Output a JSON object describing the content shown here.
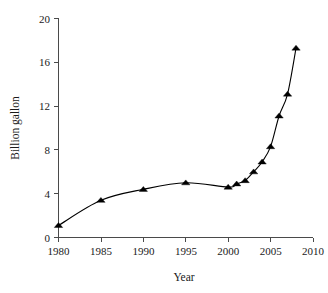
{
  "chart_data": {
    "type": "line",
    "title": "",
    "subtitle": "",
    "xlabel": "Year",
    "ylabel": "Billion gallon",
    "xlim": [
      1980,
      2010
    ],
    "ylim": [
      0,
      20
    ],
    "xticks": [
      1980,
      1985,
      1990,
      1995,
      2000,
      2005,
      2010
    ],
    "yticks": [
      0,
      4,
      8,
      12,
      16,
      20
    ],
    "grid": false,
    "legend": false,
    "legend_position": "none",
    "marker": "triangle-up",
    "marker_color": "#000000",
    "line_color": "#000000",
    "x": [
      1980,
      1985,
      1990,
      1995,
      2000,
      2001,
      2002,
      2003,
      2004,
      2005,
      2006,
      2007,
      2008
    ],
    "series": [
      {
        "name": "Billion gallon",
        "values": [
          1.1,
          3.4,
          4.4,
          5.0,
          4.6,
          4.9,
          5.2,
          6.0,
          6.9,
          8.3,
          11.1,
          13.1,
          17.3
        ]
      }
    ],
    "annotations": []
  },
  "axis": {
    "y_title": "Billion gallon",
    "x_title": "Year",
    "y_tick_labels": [
      "0",
      "4",
      "8",
      "12",
      "16",
      "20"
    ],
    "x_tick_labels": [
      "1980",
      "1985",
      "1990",
      "1995",
      "2000",
      "2005",
      "2010"
    ]
  },
  "colors": {
    "line": "#000000",
    "marker": "#000000",
    "axis": "#4a4a4a",
    "text": "#1a1a1a",
    "background": "#ffffff"
  }
}
